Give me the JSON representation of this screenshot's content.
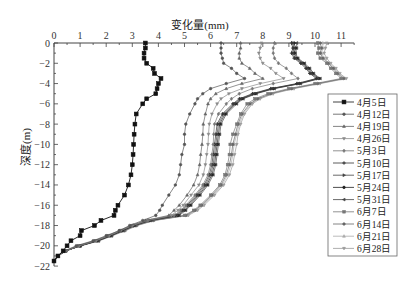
{
  "chart": {
    "title": "变化量(mm)",
    "ylabel": "深度(m)"
  },
  "chart_data": {
    "type": "line",
    "title": "变化量(mm)",
    "xlabel": "变化量(mm)",
    "ylabel": "深度(m)",
    "xlim": [
      0,
      11.5
    ],
    "ylim": [
      -22,
      0
    ],
    "x_axis_position": "top",
    "xticks": [
      0,
      1,
      2,
      3,
      4,
      5,
      6,
      7,
      8,
      9,
      10,
      11
    ],
    "yticks": [
      0,
      -2,
      -4,
      -6,
      -8,
      -10,
      -12,
      -14,
      -16,
      -18,
      -20,
      -22
    ],
    "grid": false,
    "legend_position": "right",
    "depth": [
      0,
      -0.5,
      -1,
      -1.5,
      -2,
      -2.5,
      -3,
      -3.5,
      -4,
      -4.5,
      -5,
      -5.5,
      -6,
      -7,
      -8,
      -9,
      -10,
      -11,
      -12,
      -13,
      -14,
      -15,
      -16,
      -16.5,
      -17,
      -17.5,
      -18,
      -18.5,
      -19,
      -19.5,
      -20,
      -20.5,
      -21,
      -21.5
    ],
    "series": [
      {
        "name": "4月5日",
        "color": "#111111",
        "marker": "square",
        "values": [
          3.5,
          3.5,
          3.45,
          3.45,
          3.55,
          3.8,
          3.85,
          4.1,
          4.0,
          3.95,
          3.9,
          3.55,
          3.4,
          3.15,
          3.1,
          3.07,
          3.05,
          3.03,
          3.0,
          2.95,
          2.85,
          2.7,
          2.45,
          2.35,
          2.3,
          1.8,
          1.55,
          1.05,
          1.0,
          0.65,
          0.5,
          0.35,
          0.15,
          0
        ]
      },
      {
        "name": "4月12日",
        "color": "#555555",
        "marker": "circle",
        "values": [
          6.4,
          6.4,
          6.4,
          6.45,
          6.5,
          6.8,
          7.0,
          7.3,
          6.6,
          6.0,
          5.7,
          5.5,
          5.4,
          5.2,
          5.05,
          5.0,
          5.0,
          4.9,
          4.85,
          4.8,
          4.65,
          4.4,
          4.15,
          4.05,
          3.9,
          3.4,
          2.9,
          2.5,
          2.0,
          1.5,
          0.85,
          0.4,
          0.15,
          0
        ]
      },
      {
        "name": "4月19日",
        "color": "#666666",
        "marker": "triangle-up",
        "values": [
          7.15,
          7.15,
          7.1,
          7.1,
          7.2,
          7.5,
          7.7,
          8.0,
          7.2,
          6.6,
          6.2,
          6.0,
          5.9,
          5.8,
          5.72,
          5.7,
          5.67,
          5.62,
          5.58,
          5.5,
          5.35,
          5.1,
          4.8,
          4.6,
          4.4,
          3.5,
          2.95,
          2.5,
          2.05,
          1.55,
          0.9,
          0.42,
          0.15,
          0
        ]
      },
      {
        "name": "4月26日",
        "color": "#8a8a8a",
        "marker": "triangle-down",
        "values": [
          7.95,
          7.9,
          7.85,
          7.9,
          8.0,
          8.3,
          8.5,
          8.8,
          7.9,
          7.2,
          6.7,
          6.4,
          6.25,
          6.05,
          5.95,
          5.92,
          5.9,
          5.85,
          5.8,
          5.72,
          5.55,
          5.25,
          4.95,
          4.75,
          4.5,
          3.55,
          3.0,
          2.55,
          2.1,
          1.6,
          0.95,
          0.45,
          0.15,
          0
        ]
      },
      {
        "name": "5月3日",
        "color": "#777777",
        "marker": "diamond",
        "values": [
          8.45,
          8.4,
          8.4,
          8.45,
          8.6,
          8.9,
          9.1,
          9.35,
          8.4,
          7.6,
          7.1,
          6.8,
          6.6,
          6.3,
          6.15,
          6.12,
          6.1,
          6.05,
          6.0,
          5.9,
          5.7,
          5.4,
          5.05,
          4.85,
          4.6,
          3.6,
          3.0,
          2.55,
          2.1,
          1.6,
          0.95,
          0.45,
          0.15,
          0
        ]
      },
      {
        "name": "5月10日",
        "color": "#333333",
        "marker": "plus",
        "values": [
          9.1,
          9.15,
          9.1,
          9.2,
          9.45,
          9.65,
          9.8,
          10.05,
          9.3,
          8.3,
          7.6,
          7.1,
          6.85,
          6.45,
          6.25,
          6.2,
          6.15,
          6.1,
          6.05,
          5.95,
          5.75,
          5.45,
          5.1,
          4.9,
          4.65,
          3.6,
          3.05,
          2.6,
          2.15,
          1.65,
          1.0,
          0.45,
          0.15,
          0
        ]
      },
      {
        "name": "5月17日",
        "color": "#444444",
        "marker": "triangle-right",
        "values": [
          9.15,
          9.2,
          9.15,
          9.25,
          9.5,
          9.7,
          9.85,
          10.1,
          9.35,
          8.35,
          7.65,
          7.15,
          6.9,
          6.5,
          6.3,
          6.25,
          6.2,
          6.15,
          6.1,
          6.0,
          5.8,
          5.5,
          5.15,
          4.95,
          4.7,
          3.65,
          3.05,
          2.6,
          2.15,
          1.65,
          1.0,
          0.45,
          0.15,
          0
        ]
      },
      {
        "name": "5月24日",
        "color": "#222222",
        "marker": "circle",
        "values": [
          9.2,
          9.25,
          9.2,
          9.3,
          9.55,
          9.75,
          9.9,
          10.15,
          9.4,
          8.4,
          7.7,
          7.2,
          6.95,
          6.55,
          6.35,
          6.3,
          6.25,
          6.2,
          6.15,
          6.05,
          5.85,
          5.55,
          5.2,
          5.0,
          4.75,
          3.65,
          3.05,
          2.6,
          2.15,
          1.65,
          1.0,
          0.45,
          0.15,
          0
        ]
      },
      {
        "name": "5月31日",
        "color": "#444444",
        "marker": "triangle-left",
        "values": [
          9.3,
          9.3,
          9.25,
          9.35,
          9.6,
          9.8,
          9.95,
          10.2,
          9.45,
          8.45,
          7.75,
          7.25,
          7.0,
          6.6,
          6.4,
          6.35,
          6.3,
          6.25,
          6.2,
          6.1,
          5.9,
          5.6,
          5.25,
          5.05,
          4.8,
          3.7,
          3.1,
          2.65,
          2.2,
          1.7,
          1.0,
          0.45,
          0.15,
          0
        ]
      },
      {
        "name": "6月7日",
        "color": "#777777",
        "marker": "square",
        "values": [
          10.1,
          10.15,
          10.1,
          10.2,
          10.45,
          10.6,
          10.8,
          11.0,
          10.0,
          9.0,
          8.2,
          7.7,
          7.4,
          7.15,
          7.0,
          6.85,
          6.75,
          6.72,
          6.65,
          6.55,
          6.35,
          6.0,
          5.6,
          5.35,
          5.0,
          3.75,
          3.1,
          2.65,
          2.2,
          1.7,
          1.0,
          0.45,
          0.15,
          0
        ]
      },
      {
        "name": "6月14日",
        "color": "#666666",
        "marker": "circle",
        "values": [
          10.2,
          10.25,
          10.2,
          10.3,
          10.5,
          10.7,
          10.85,
          11.1,
          10.1,
          9.1,
          8.3,
          7.8,
          7.5,
          7.2,
          7.05,
          6.95,
          6.85,
          6.8,
          6.72,
          6.6,
          6.4,
          6.05,
          5.65,
          5.4,
          5.05,
          3.8,
          3.15,
          2.7,
          2.2,
          1.7,
          1.0,
          0.45,
          0.15,
          0
        ]
      },
      {
        "name": "6月21日",
        "color": "#aaaaaa",
        "marker": "triangle-up",
        "values": [
          10.3,
          10.3,
          10.25,
          10.35,
          10.55,
          10.75,
          10.9,
          11.15,
          10.15,
          9.15,
          8.35,
          7.85,
          7.55,
          7.25,
          7.1,
          7.0,
          6.9,
          6.85,
          6.78,
          6.65,
          6.45,
          6.1,
          5.7,
          5.45,
          5.1,
          3.8,
          3.15,
          2.7,
          2.2,
          1.7,
          1.0,
          0.45,
          0.15,
          0
        ]
      },
      {
        "name": "6月28日",
        "color": "#999999",
        "marker": "triangle-down",
        "values": [
          10.45,
          10.4,
          10.35,
          10.45,
          10.6,
          10.8,
          10.95,
          11.2,
          10.2,
          9.2,
          8.4,
          7.9,
          7.6,
          7.3,
          7.15,
          7.05,
          7.0,
          6.92,
          6.85,
          6.72,
          6.5,
          6.15,
          5.75,
          5.5,
          5.15,
          3.85,
          3.2,
          2.75,
          2.25,
          1.75,
          1.05,
          0.45,
          0.15,
          0
        ]
      }
    ]
  }
}
